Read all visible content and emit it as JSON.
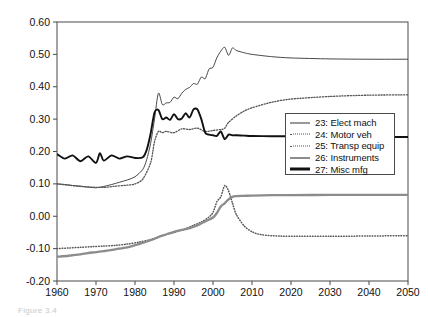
{
  "chart_data": {
    "type": "line",
    "title": "",
    "xlabel": "",
    "ylabel": "",
    "xlim": [
      1960,
      2050
    ],
    "ylim": [
      -0.2,
      0.6
    ],
    "xticks": [
      "1960",
      "1970",
      "1980",
      "1990",
      "2000",
      "2010",
      "2020",
      "2030",
      "2040",
      "2050"
    ],
    "yticks": [
      "0.60",
      "0.50",
      "0.40",
      "0.30",
      "0.20",
      "0.10",
      "0.00",
      "-0.10",
      "-0.20"
    ],
    "grid": false,
    "legend_position": "center-right",
    "series": [
      {
        "name": "23: Elect mach",
        "style": "solid-thin",
        "color": "#333333",
        "x": [
          1960,
          1962,
          1964,
          1966,
          1968,
          1970,
          1972,
          1974,
          1976,
          1978,
          1980,
          1982,
          1983,
          1984,
          1985,
          1986,
          1987,
          1988,
          1989,
          1990,
          1991,
          1992,
          1993,
          1994,
          1995,
          1996,
          1997,
          1998,
          1999,
          2000,
          2001,
          2002,
          2003,
          2004,
          2005,
          2006,
          2008,
          2010,
          2015,
          2020,
          2030,
          2040,
          2050
        ],
        "values": [
          0.1,
          0.098,
          0.095,
          0.093,
          0.09,
          0.088,
          0.092,
          0.098,
          0.105,
          0.112,
          0.122,
          0.145,
          0.175,
          0.225,
          0.3,
          0.38,
          0.345,
          0.35,
          0.352,
          0.368,
          0.363,
          0.38,
          0.392,
          0.398,
          0.41,
          0.408,
          0.43,
          0.425,
          0.455,
          0.46,
          0.49,
          0.51,
          0.522,
          0.497,
          0.52,
          0.512,
          0.505,
          0.5,
          0.493,
          0.489,
          0.486,
          0.485,
          0.485
        ]
      },
      {
        "name": "24: Motor veh",
        "style": "dotted-fine",
        "color": "#555555",
        "x": [
          1960,
          1963,
          1966,
          1969,
          1972,
          1975,
          1978,
          1981,
          1984,
          1987,
          1990,
          1993,
          1995,
          1997,
          1999,
          2000,
          2001,
          2002,
          2003,
          2004,
          2005,
          2006,
          2008,
          2010,
          2012,
          2015,
          2020,
          2030,
          2040,
          2050
        ],
        "values": [
          -0.1,
          -0.098,
          -0.096,
          -0.094,
          -0.092,
          -0.09,
          -0.086,
          -0.08,
          -0.072,
          -0.06,
          -0.05,
          -0.038,
          -0.028,
          -0.018,
          -0.002,
          0.012,
          0.045,
          0.06,
          0.095,
          0.078,
          0.04,
          0.005,
          -0.03,
          -0.048,
          -0.056,
          -0.06,
          -0.062,
          -0.062,
          -0.061,
          -0.06
        ]
      },
      {
        "name": "25: Transp equip",
        "style": "dotted-coarse",
        "color": "#555555",
        "x": [
          1960,
          1963,
          1966,
          1969,
          1972,
          1975,
          1978,
          1980,
          1982,
          1984,
          1985,
          1986,
          1987,
          1988,
          1990,
          1992,
          1994,
          1996,
          1998,
          2000,
          2002,
          2003,
          2004,
          2006,
          2008,
          2010,
          2015,
          2020,
          2030,
          2040,
          2050
        ],
        "values": [
          0.1,
          0.096,
          0.092,
          0.09,
          0.089,
          0.093,
          0.096,
          0.1,
          0.115,
          0.165,
          0.23,
          0.262,
          0.258,
          0.262,
          0.258,
          0.27,
          0.268,
          0.272,
          0.262,
          0.265,
          0.268,
          0.272,
          0.29,
          0.31,
          0.325,
          0.335,
          0.352,
          0.362,
          0.37,
          0.374,
          0.375
        ]
      },
      {
        "name": "26: Instruments",
        "style": "solid-gray",
        "color": "#8c8c8c",
        "x": [
          1960,
          1963,
          1966,
          1969,
          1972,
          1975,
          1978,
          1981,
          1984,
          1987,
          1990,
          1993,
          1996,
          1998,
          2000,
          2001,
          2002,
          2003,
          2004,
          2005,
          2006,
          2008,
          2010,
          2015,
          2020,
          2030,
          2040,
          2050
        ],
        "values": [
          -0.125,
          -0.122,
          -0.118,
          -0.112,
          -0.108,
          -0.102,
          -0.096,
          -0.086,
          -0.074,
          -0.06,
          -0.048,
          -0.04,
          -0.028,
          -0.016,
          -0.004,
          0.01,
          0.03,
          0.04,
          0.052,
          0.06,
          0.062,
          0.063,
          0.064,
          0.065,
          0.065,
          0.066,
          0.066,
          0.066
        ]
      },
      {
        "name": "27: Misc mfg",
        "style": "solid-bold",
        "color": "#111111",
        "x": [
          1960,
          1962,
          1964,
          1966,
          1968,
          1970,
          1971,
          1972,
          1974,
          1976,
          1978,
          1980,
          1982,
          1983,
          1984,
          1985,
          1986,
          1987,
          1988,
          1989,
          1990,
          1991,
          1992,
          1993,
          1994,
          1995,
          1996,
          1997,
          1998,
          1999,
          2000,
          2001,
          2002,
          2003,
          2004,
          2005,
          2006,
          2008,
          2010,
          2015,
          2020,
          2030,
          2040,
          2050
        ],
        "values": [
          0.192,
          0.178,
          0.188,
          0.17,
          0.185,
          0.165,
          0.195,
          0.172,
          0.188,
          0.178,
          0.185,
          0.18,
          0.182,
          0.205,
          0.255,
          0.32,
          0.328,
          0.3,
          0.305,
          0.298,
          0.315,
          0.3,
          0.302,
          0.318,
          0.305,
          0.33,
          0.33,
          0.3,
          0.258,
          0.252,
          0.25,
          0.248,
          0.262,
          0.238,
          0.252,
          0.25,
          0.25,
          0.249,
          0.248,
          0.247,
          0.247,
          0.246,
          0.245,
          0.245
        ]
      }
    ]
  },
  "legend": {
    "items": [
      {
        "label": "23: Elect mach",
        "style": "sw-solid-thin"
      },
      {
        "label": "24: Motor veh",
        "style": "sw-dot-fine"
      },
      {
        "label": "25: Transp equip",
        "style": "sw-dot-coarse"
      },
      {
        "label": "26: Instruments",
        "style": "sw-gray"
      },
      {
        "label": "27: Misc mfg",
        "style": "sw-bold"
      }
    ]
  },
  "caption": {
    "text": "Figure 3.4"
  }
}
